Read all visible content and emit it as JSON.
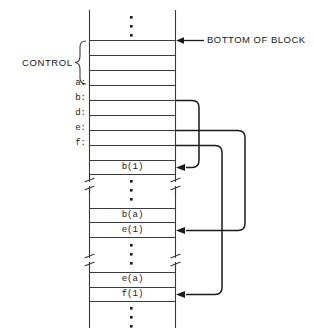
{
  "figure": {
    "stroke_color": "#3a3a3a",
    "text_color": "#1a1a1a",
    "background": "#ffffff"
  },
  "annotations": {
    "control_label": "CONTROL",
    "bottom_of_block_label": "BOTTOM OF BLOCK"
  },
  "side_labels": [
    {
      "name": "a",
      "text": "a:"
    },
    {
      "name": "b",
      "text": "b:"
    },
    {
      "name": "d",
      "text": "d:"
    },
    {
      "name": "e",
      "text": "e:"
    },
    {
      "name": "f",
      "text": "f:"
    }
  ],
  "cells": [
    {
      "name": "b-1",
      "text": "b(1)"
    },
    {
      "name": "b-a",
      "text": "b(a)"
    },
    {
      "name": "e-1",
      "text": "e(1)"
    },
    {
      "name": "e-a",
      "text": "e(a)"
    },
    {
      "name": "f-1",
      "text": "f(1)"
    }
  ],
  "ellipses": [
    {
      "name": "top-ellipsis"
    },
    {
      "name": "middle-ellipsis-1"
    },
    {
      "name": "middle-ellipsis-2"
    },
    {
      "name": "bottom-ellipsis"
    }
  ],
  "pointers": [
    {
      "name": "pointer-b-to-b1",
      "from": "b:",
      "to": "b(1)"
    },
    {
      "name": "pointer-e-to-e1",
      "from": "e:",
      "to": "e(1)"
    },
    {
      "name": "pointer-f-to-f1",
      "from": "f:",
      "to": "f(1)"
    }
  ]
}
